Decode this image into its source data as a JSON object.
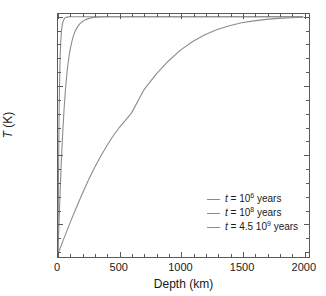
{
  "chart_data": {
    "type": "line",
    "title": "",
    "xlabel": "Depth (km)",
    "ylabel": "T (K)",
    "xlim": [
      0,
      2050
    ],
    "ylim": [
      250,
      2020
    ],
    "grid": false,
    "legend_position": "lower-right",
    "xticks": [
      0,
      500,
      1000,
      1500,
      2000
    ],
    "xticklabels": [
      "0",
      "500",
      "1000",
      "1500",
      "2000"
    ],
    "yticks": [
      500,
      1000,
      1500,
      2000
    ],
    "yticklabels": [
      "500",
      "1000",
      "1500",
      "2000"
    ],
    "x_minor_interval": 100,
    "y_minor_interval": 100,
    "surface_temperature": 273,
    "asymptote_temperature": 2000,
    "series": [
      {
        "name": "t = 10^6 years",
        "label_prefix": "t",
        "label_equals": " = 10",
        "label_exponent": "6",
        "label_suffix": " years",
        "color": "#8c8c8c",
        "diffusion_scale_km": 12,
        "x": [
          0,
          2,
          4,
          6,
          8,
          10,
          12,
          15,
          18,
          22,
          26,
          30,
          35,
          40,
          50,
          60,
          80,
          100,
          150,
          200,
          300,
          500,
          1000,
          1500,
          2000
        ],
        "y": [
          273,
          558,
          806,
          1017,
          1195,
          1344,
          1467,
          1613,
          1718,
          1811,
          1871,
          1909,
          1941,
          1961,
          1983,
          1993,
          1999,
          2000,
          2000,
          2000,
          2000,
          2000,
          2000,
          2000,
          2000
        ]
      },
      {
        "name": "t = 10^8 years",
        "label_prefix": "t",
        "label_equals": " = 10",
        "label_exponent": "8",
        "label_suffix": " years",
        "color": "#8c8c8c",
        "diffusion_scale_km": 62,
        "x": [
          0,
          10,
          20,
          30,
          40,
          50,
          60,
          70,
          80,
          90,
          100,
          120,
          140,
          160,
          180,
          200,
          230,
          260,
          300,
          350,
          400,
          500,
          700,
          1000,
          1500,
          2000
        ],
        "y": [
          273,
          546,
          788,
          999,
          1180,
          1332,
          1458,
          1561,
          1645,
          1712,
          1766,
          1844,
          1895,
          1928,
          1950,
          1965,
          1981,
          1990,
          1996,
          1999,
          2000,
          2000,
          2000,
          2000,
          2000,
          2000
        ]
      },
      {
        "name": "t = 4.5 10^9 years",
        "label_prefix": "t",
        "label_equals": " = 4.5 10",
        "label_exponent": "9",
        "label_suffix": " years",
        "color": "#8c8c8c",
        "diffusion_scale_km": 415,
        "x": [
          0,
          50,
          100,
          150,
          200,
          250,
          300,
          350,
          400,
          450,
          500,
          600,
          700,
          800,
          900,
          1000,
          1100,
          1200,
          1300,
          1400,
          1500,
          1600,
          1700,
          1800,
          1900,
          2000
        ],
        "y": [
          273,
          389,
          502,
          611,
          715,
          812,
          903,
          986,
          1062,
          1131,
          1193,
          1298,
          1465,
          1580,
          1676,
          1757,
          1820,
          1869,
          1907,
          1935,
          1956,
          1970,
          1981,
          1988,
          1993,
          1996
        ]
      }
    ]
  },
  "axis": {
    "frame_color": "#5a5a5a",
    "text_color": "#1a1a1a"
  }
}
